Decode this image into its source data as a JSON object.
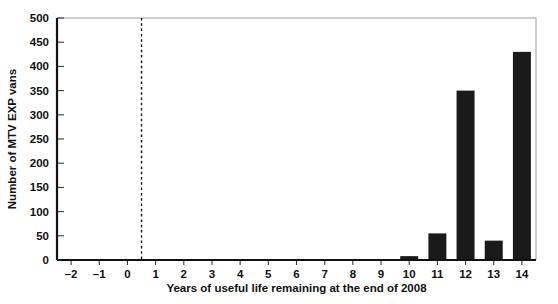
{
  "chart_data": {
    "type": "bar",
    "title": "",
    "xlabel": "Years of useful life remaining at the end of 2008",
    "ylabel": "Number of MTV EXP vans",
    "categories": [
      "-2",
      "-1",
      "0",
      "1",
      "2",
      "3",
      "4",
      "5",
      "6",
      "7",
      "8",
      "9",
      "10",
      "11",
      "12",
      "13",
      "14"
    ],
    "values": [
      0,
      0,
      0,
      0,
      0,
      0,
      0,
      0,
      0,
      0,
      0,
      0,
      8,
      55,
      350,
      40,
      430
    ],
    "xlim": [
      -2.5,
      14.5
    ],
    "ylim": [
      0,
      500
    ],
    "ytick_labels": [
      "0",
      "50",
      "100",
      "150",
      "200",
      "250",
      "300",
      "350",
      "400",
      "450",
      "500"
    ],
    "ytick_values": [
      0,
      50,
      100,
      150,
      200,
      250,
      300,
      350,
      400,
      450,
      500
    ],
    "grid": false,
    "legend": "none",
    "bar_color": "#1a1a1a",
    "annotations": [
      {
        "name": "reference-line",
        "type": "vertical-dashed-line",
        "x": 0.5,
        "color": "#111111"
      }
    ]
  }
}
